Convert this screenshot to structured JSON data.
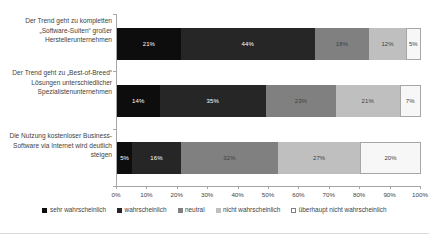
{
  "chart_data": {
    "type": "bar",
    "orientation": "horizontal",
    "stacked": true,
    "normalized_percent": true,
    "title": "",
    "subtitle": "",
    "xlabel": "",
    "ylabel": "",
    "xlim": [
      0,
      100
    ],
    "grid": false,
    "legend_position": "bottom",
    "categories": [
      "Der Trend geht zu kompletten „Software-Suiten“ großer Herstellerunternehmen",
      "Der Trend geht zu „Best-of-Breed“ Lösungen unterschiedlicher Spezialistenunternehmen",
      "Die Nutzung kostenloser Business-Software via Internet wird deutlich steigen"
    ],
    "series": [
      {
        "name": "sehr wahrscheinlich",
        "color": "#0d0d0d",
        "values": [
          21,
          14,
          5
        ]
      },
      {
        "name": "wahrscheinlich",
        "color": "#262626",
        "values": [
          44,
          35,
          16
        ]
      },
      {
        "name": "neutral",
        "color": "#808080",
        "values": [
          18,
          23,
          32
        ]
      },
      {
        "name": "nicht wahrscheinlich",
        "color": "#bfbfbf",
        "values": [
          12,
          21,
          27
        ]
      },
      {
        "name": "überhaupt nicht wahrscheinlich",
        "color": "#f7f7f7",
        "values": [
          5,
          7,
          20
        ]
      }
    ],
    "data_labels": [
      [
        "21%",
        "44%",
        "18%",
        "12%",
        "5%"
      ],
      [
        "14%",
        "35%",
        "23%",
        "21%",
        "7%"
      ],
      [
        "5%",
        "16%",
        "32%",
        "27%",
        "20%"
      ]
    ],
    "xticks": [
      0,
      10,
      20,
      30,
      40,
      50,
      60,
      70,
      80,
      90,
      100
    ],
    "xtick_labels": [
      "0%",
      "10%",
      "20%",
      "30%",
      "40%",
      "50%",
      "60%",
      "70%",
      "80%",
      "90%",
      "100%"
    ]
  },
  "legend": {
    "items": [
      {
        "label": "sehr wahrscheinlich",
        "color": "#0d0d0d"
      },
      {
        "label": "wahrscheinlich",
        "color": "#262626"
      },
      {
        "label": "neutral",
        "color": "#808080"
      },
      {
        "label": "nicht wahrscheinlich",
        "color": "#bfbfbf"
      },
      {
        "label": "überhaupt nicht wahrscheinlich",
        "color": "#ffffff"
      }
    ]
  },
  "colors": {
    "axis": "#a6a6a6",
    "text": "#3f3f3f",
    "background": "#ffffff",
    "segment_border": "#a6a6a6",
    "label_on_dark": "#ffffff",
    "label_on_light": "#3f3f3f"
  }
}
